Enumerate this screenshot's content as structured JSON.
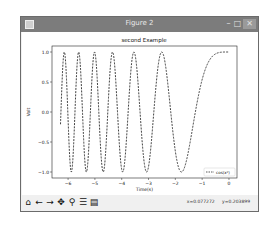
{
  "window": {
    "title": "Figure 2",
    "minimize_glyph": "–",
    "maximize_glyph": "□",
    "close_glyph": "✕"
  },
  "toolbar": {
    "buttons": [
      {
        "name": "home",
        "glyph": "⌂"
      },
      {
        "name": "back",
        "glyph": "←"
      },
      {
        "name": "forward",
        "glyph": "→"
      },
      {
        "name": "pan",
        "glyph": "✥"
      },
      {
        "name": "zoom",
        "glyph": "⚲"
      },
      {
        "name": "configure-subplots",
        "glyph": "☰"
      },
      {
        "name": "save",
        "glyph": "▤"
      }
    ],
    "x_readout": "x=0.077272",
    "y_readout": "y=0.203899"
  },
  "chart_data": {
    "type": "line",
    "title": "second Example",
    "xlabel": "Time(s)",
    "ylabel": "Volt",
    "xlim": [
      -6.6,
      0.3
    ],
    "ylim": [
      -1.1,
      1.1
    ],
    "xticks": [
      -6,
      -5,
      -4,
      -3,
      -2,
      -1,
      0
    ],
    "xtick_labels": [
      "−6",
      "−5",
      "−4",
      "−3",
      "−2",
      "−1",
      "0"
    ],
    "yticks": [
      -1.0,
      -0.5,
      0.0,
      0.5,
      1.0
    ],
    "ytick_labels": [
      "−1.0",
      "−0.5",
      "0.0",
      "0.5",
      "1.0"
    ],
    "grid": false,
    "legend_position": "lower-right",
    "series": [
      {
        "name": "cos(x²)",
        "function": "cos(x^2)",
        "x_range": [
          -6.283,
          0
        ],
        "line_style": "dashed",
        "color": "#000000"
      }
    ]
  }
}
